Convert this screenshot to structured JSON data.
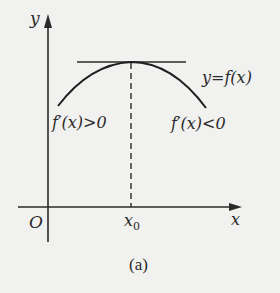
{
  "figure": {
    "caption": "(a)",
    "axes": {
      "x_label": "x",
      "y_label": "y",
      "origin_label": "O"
    },
    "point": {
      "label": "x",
      "subscript": "0"
    },
    "curve_label": "y=f(x)",
    "left_annotation": "f′(x)>0",
    "right_annotation": "f′(x)<0",
    "elements": [
      "concave-down curve with maximum at x0",
      "horizontal tangent line at the maximum",
      "dashed vertical line from maximum down to x0 on x-axis"
    ],
    "colors": {
      "background": "#f1f1ef",
      "ink": "#2a2a2a"
    }
  }
}
